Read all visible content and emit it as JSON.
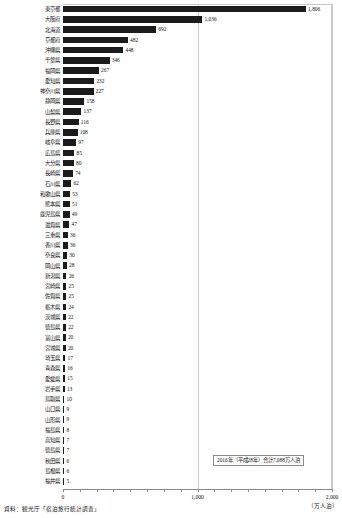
{
  "chart_data": {
    "type": "bar",
    "orientation": "horizontal",
    "title": "",
    "xlabel": "",
    "ylabel": "",
    "xlim": [
      0,
      2000
    ],
    "xticks": [
      0,
      1000,
      2000
    ],
    "xtick_labels": [
      "0",
      "1,000",
      "2,000"
    ],
    "unit_label": "（万人泊）",
    "grid": true,
    "legend_position": "bottom-right",
    "categories": [
      "東京都",
      "大阪府",
      "北海道",
      "京都府",
      "沖縄県",
      "千葉県",
      "福岡県",
      "愛知県",
      "神奈川県",
      "静岡県",
      "山梨県",
      "長野県",
      "兵庫県",
      "岐阜県",
      "広島県",
      "大分県",
      "長崎県",
      "石川県",
      "和歌山県",
      "熊本県",
      "鹿児島県",
      "滋賀県",
      "三重県",
      "香川県",
      "奈良県",
      "岡山県",
      "新潟県",
      "宮崎県",
      "佐賀県",
      "栃木県",
      "茨城県",
      "徳島県",
      "富山県",
      "宮城県",
      "埼玉県",
      "青森県",
      "愛媛県",
      "岩手県",
      "鳥取県",
      "山口県",
      "山形県",
      "福島県",
      "高知県",
      "徳島県",
      "秋田県",
      "島根県",
      "福井県"
    ],
    "values": [
      1806,
      1036,
      692,
      482,
      448,
      346,
      267,
      232,
      227,
      158,
      137,
      116,
      108,
      97,
      85,
      80,
      74,
      62,
      53,
      51,
      49,
      47,
      36,
      36,
      30,
      28,
      26,
      25,
      25,
      24,
      22,
      22,
      20,
      20,
      17,
      16,
      15,
      13,
      10,
      9,
      9,
      8,
      7,
      7,
      6,
      6,
      5
    ],
    "value_labels": [
      "1,806",
      "1,036",
      "692",
      "482",
      "448",
      "346",
      "267",
      "232",
      "227",
      "158",
      "137",
      "116",
      "108",
      "97",
      "85",
      "80",
      "74",
      "62",
      "53",
      "51",
      "49",
      "47",
      "36",
      "36",
      "30",
      "28",
      "26",
      "25",
      "25",
      "24",
      "22",
      "22",
      "20",
      "20",
      "17",
      "16",
      "15",
      "13",
      "10",
      "9",
      "9",
      "8",
      "7",
      "7",
      "6",
      "6",
      "5"
    ],
    "annotations": [
      "2016年（平成28年）合計7,088万人泊"
    ]
  },
  "legend": {
    "text": "2016年（平成28年）合計7,088万人泊"
  },
  "footer": {
    "source": "資料：観光庁「宿泊旅行統計調査」"
  },
  "colors": {
    "bar": "#1b1b1b",
    "grid": "#cccccc",
    "frame": "#c8c8c8",
    "axis": "#8a8a8a",
    "text": "#111111"
  }
}
